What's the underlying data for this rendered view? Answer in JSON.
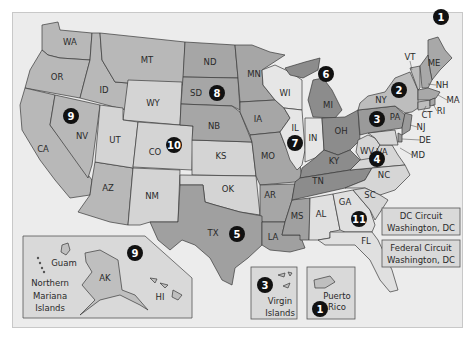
{
  "colors": {
    "background": "#ececec",
    "shade_light": "#e2e2e2",
    "shade_mid_light": "#c9c9c9",
    "shade_mid": "#b8b8b8",
    "shade_dark": "#a0a0a0",
    "shade_darker": "#8a8a8a",
    "badge": "#111111"
  },
  "states": {
    "WA": "WA",
    "OR": "OR",
    "CA": "CA",
    "ID": "ID",
    "NV": "NV",
    "MT": "MT",
    "WY": "WY",
    "UT": "UT",
    "AZ": "AZ",
    "CO": "CO",
    "NM": "NM",
    "ND": "ND",
    "SD": "SD",
    "NB": "NB",
    "KS": "KS",
    "OK": "OK",
    "TX": "TX",
    "MN": "MN",
    "IA": "IA",
    "MO": "MO",
    "AR": "AR",
    "LA": "LA",
    "WI": "WI",
    "IL": "IL",
    "MI": "MI",
    "IN": "IN",
    "OH": "OH",
    "KY": "KY",
    "TN": "TN",
    "MS": "MS",
    "AL": "AL",
    "GA": "GA",
    "FL": "FL",
    "SC": "SC",
    "NC": "NC",
    "VA": "VA",
    "WV": "WV",
    "MD": "MD",
    "DE": "DE",
    "NJ": "NJ",
    "PA": "PA",
    "NY": "NY",
    "CT": "CT",
    "RI": "RI",
    "MA": "MA",
    "VT": "VT",
    "NH": "NH",
    "ME": "ME",
    "AK": "AK",
    "HI": "HI"
  },
  "circuits": {
    "c1": "1",
    "c2": "2",
    "c3": "3",
    "c4": "4",
    "c5": "5",
    "c6": "6",
    "c7": "7",
    "c8": "8",
    "c9": "9",
    "c10": "10",
    "c11": "11",
    "c9_inset": "9",
    "c3_inset": "3",
    "c1_inset": "1"
  },
  "insets": {
    "guam": "Guam",
    "nmi_line1": "Northern",
    "nmi_line2": "Mariana",
    "nmi_line3": "Islands",
    "vi_line1": "Virgin",
    "vi_line2": "Islands",
    "pr_line1": "Puerto",
    "pr_line2": "Rico"
  },
  "dc_boxes": {
    "dc_circuit_title": "DC Circuit",
    "dc_circuit_city": "Washington, DC",
    "federal_circuit_title": "Federal Circuit",
    "federal_circuit_city": "Washington, DC"
  }
}
